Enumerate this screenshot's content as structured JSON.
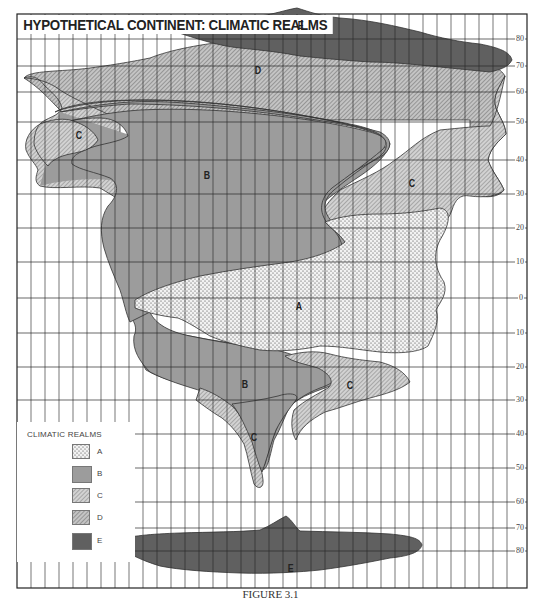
{
  "title": "HYPOTHETICAL CONTINENT: CLIMATIC REALMS",
  "caption": "FIGURE 3.1",
  "legend": {
    "title": "CLIMATIC REALMS",
    "items": [
      {
        "key": "A",
        "pattern": "stipple",
        "color": "#e8e8e8"
      },
      {
        "key": "B",
        "pattern": "solid-gray",
        "color": "#9a9a9a"
      },
      {
        "key": "C",
        "pattern": "fine-hatch",
        "color": "#c4c4c4"
      },
      {
        "key": "D",
        "pattern": "hatch",
        "color": "#b4b4b4"
      },
      {
        "key": "E",
        "pattern": "dark-solid",
        "color": "#5e5e5e"
      }
    ]
  },
  "latitude_labels": [
    {
      "label": "80",
      "y": 39
    },
    {
      "label": "70",
      "y": 66
    },
    {
      "label": "60",
      "y": 92
    },
    {
      "label": "50",
      "y": 122
    },
    {
      "label": "40",
      "y": 160
    },
    {
      "label": "30",
      "y": 194
    },
    {
      "label": "20",
      "y": 228
    },
    {
      "label": "10",
      "y": 262
    },
    {
      "label": "0",
      "y": 298
    },
    {
      "label": "10",
      "y": 333
    },
    {
      "label": "20",
      "y": 367
    },
    {
      "label": "30",
      "y": 400
    },
    {
      "label": "40",
      "y": 434
    },
    {
      "label": "50",
      "y": 468
    },
    {
      "label": "60",
      "y": 502
    },
    {
      "label": "70",
      "y": 528
    },
    {
      "label": "80",
      "y": 551
    }
  ],
  "region_labels": [
    {
      "text": "E",
      "x": 297,
      "y": 22
    },
    {
      "text": "D",
      "x": 254,
      "y": 67
    },
    {
      "text": "C",
      "x": 75,
      "y": 132
    },
    {
      "text": "B",
      "x": 203,
      "y": 172
    },
    {
      "text": "C",
      "x": 408,
      "y": 180
    },
    {
      "text": "A",
      "x": 295,
      "y": 303
    },
    {
      "text": "B",
      "x": 241,
      "y": 381
    },
    {
      "text": "C",
      "x": 346,
      "y": 382
    },
    {
      "text": "C",
      "x": 250,
      "y": 434
    },
    {
      "text": "E",
      "x": 287,
      "y": 565
    }
  ],
  "colors": {
    "grid": "#333333",
    "A_bg": "#f4f4f4",
    "B": "#9c9c9c",
    "C": "#c6c6c6",
    "D": "#b8b8b8",
    "E": "#606060"
  }
}
